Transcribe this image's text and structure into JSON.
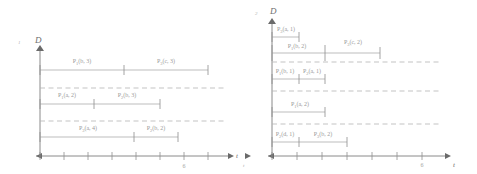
{
  "figure": {
    "type": "gantt-schedule-diagram",
    "panel_count": 2,
    "stroke_color": "#9a9a9a",
    "axis_color": "#7d7d7d",
    "divider_color": "#b4b4b4"
  },
  "panels": [
    {
      "id": "left",
      "corner_label": "1",
      "y_axis_label": "D",
      "x_axis_label": "t",
      "x_ticks": [
        {
          "value": "",
          "x": 0
        },
        {
          "value": "",
          "x": 1
        },
        {
          "value": "",
          "x": 2
        },
        {
          "value": "",
          "x": 3
        },
        {
          "value": "",
          "x": 4
        },
        {
          "value": "",
          "x": 5
        },
        {
          "value": "6",
          "x": 6
        },
        {
          "value": "",
          "x": 7
        }
      ],
      "lanes": [
        {
          "index": 0,
          "bars": [
            {
              "label_main": "P",
              "label_sub": "1",
              "label_args": "(b, 3)",
              "start": 0,
              "end": 3
            },
            {
              "label_main": "P",
              "label_sub": "3",
              "label_args": "(c, 3)",
              "start": 3,
              "end": 6.2
            }
          ]
        },
        {
          "index": 1,
          "bars": [
            {
              "label_main": "P",
              "label_sub": "1",
              "label_args": "(a, 2)",
              "start": 0,
              "end": 2
            },
            {
              "label_main": "P",
              "label_sub": "2",
              "label_args": "(b, 3)",
              "start": 2,
              "end": 4.4
            }
          ]
        },
        {
          "index": 2,
          "bars": [
            {
              "label_main": "P",
              "label_sub": "3",
              "label_args": "(a, 4)",
              "start": 0,
              "end": 3.6
            },
            {
              "label_main": "P",
              "label_sub": "2",
              "label_args": "(b, 2)",
              "start": 3.6,
              "end": 5.2
            }
          ]
        }
      ]
    },
    {
      "id": "right",
      "corner_label": "2",
      "y_axis_label": "D",
      "x_axis_label": "t",
      "left_outside_label": "t",
      "x_ticks": [
        {
          "value": "",
          "x": 0
        },
        {
          "value": "",
          "x": 1
        },
        {
          "value": "",
          "x": 2
        },
        {
          "value": "",
          "x": 3
        },
        {
          "value": "",
          "x": 4
        },
        {
          "value": "",
          "x": 5
        },
        {
          "value": "6",
          "x": 6
        },
        {
          "value": "",
          "x": 7
        }
      ],
      "lanes": [
        {
          "index": 0,
          "bars": [
            {
              "label_main": "P",
              "label_sub": "3",
              "label_args": "(a, 1)",
              "start": 0,
              "end": 1.1,
              "row": 0
            },
            {
              "label_main": "P",
              "label_sub": "1",
              "label_args": "(b, 2)",
              "start": 0,
              "end": 2.3,
              "row": 1
            },
            {
              "label_main": "P",
              "label_sub": "3",
              "label_args": "(c, 2)",
              "start": 2.3,
              "end": 4.2,
              "row": 1
            }
          ]
        },
        {
          "index": 1,
          "bars": [
            {
              "label_main": "P",
              "label_sub": "1",
              "label_args": "(b, 1)",
              "start": 0,
              "end": 1.1,
              "row": 0
            },
            {
              "label_main": "P",
              "label_sub": "2",
              "label_args": "(a, 1)",
              "start": 1.1,
              "end": 2.3,
              "row": 0
            }
          ]
        },
        {
          "index": 2,
          "bars": [
            {
              "label_main": "P",
              "label_sub": "1",
              "label_args": "(a, 2)",
              "start": 0,
              "end": 2.3,
              "row": 0
            }
          ]
        },
        {
          "index": 3,
          "bars": [
            {
              "label_main": "P",
              "label_sub": "2",
              "label_args": "(d, 1)",
              "start": 0,
              "end": 1.1,
              "row": 0
            },
            {
              "label_main": "P",
              "label_sub": "3",
              "label_args": "(b, 2)",
              "start": 1.1,
              "end": 3.1,
              "row": 0
            }
          ]
        }
      ]
    }
  ]
}
